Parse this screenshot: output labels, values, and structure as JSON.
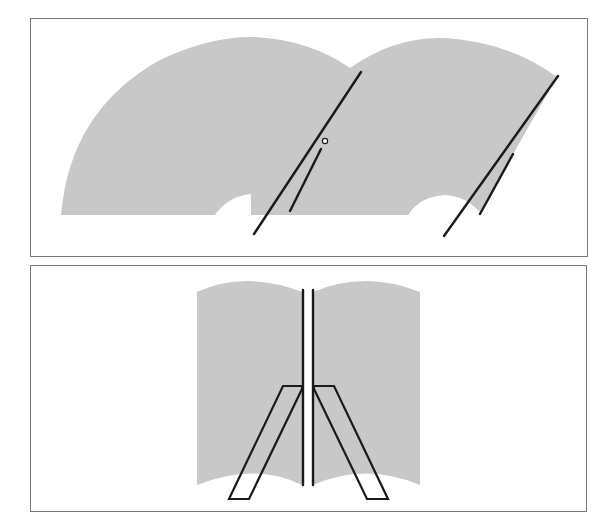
{
  "diagram": {
    "type": "windshield-wiper-sweep-patterns",
    "colors": {
      "sweep_fill": "#c8c8c8",
      "line": "#1a1a1a",
      "frame": "#7a7a7a",
      "background": "#ffffff"
    },
    "panels": [
      {
        "id": "top",
        "description": "Tandem (same-direction) wiper sweep pattern with two overlapping arc-shaped wiped areas",
        "sweeps": [
          {
            "name": "left-sweep",
            "shape": "fan-arc with notch"
          },
          {
            "name": "right-sweep",
            "shape": "fan-arc with notch"
          }
        ],
        "wipers": [
          {
            "name": "left-wiper",
            "blade": [
              [
                361,
                72
              ],
              [
                254,
                234
              ]
            ],
            "arm": [
              [
                320,
                148
              ],
              [
                290,
                211
              ]
            ],
            "pivot": [
              325,
              141
            ]
          },
          {
            "name": "right-wiper",
            "blade": [
              [
                558,
                76
              ],
              [
                444,
                236
              ]
            ],
            "arm": [
              [
                513,
                155
              ],
              [
                480,
                214
              ]
            ]
          }
        ]
      },
      {
        "id": "bottom",
        "description": "Opposed wiper pattern with two parallel vertical blades and parallelogram arms",
        "sweeps": [
          {
            "name": "left-sweep",
            "shape": "rectangle with arched top and bottom"
          },
          {
            "name": "right-sweep",
            "shape": "rectangle with arched top and bottom"
          }
        ],
        "wipers": [
          {
            "name": "left-wiper",
            "blade_x": 303,
            "arm": "parallelogram"
          },
          {
            "name": "right-wiper",
            "blade_x": 313,
            "arm": "parallelogram"
          }
        ]
      }
    ]
  }
}
